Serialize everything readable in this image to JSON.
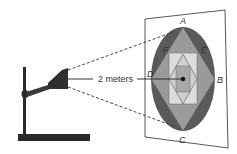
{
  "diagram": {
    "distance_label": "2 meters",
    "points": {
      "A": "A",
      "B": "B",
      "C": "C",
      "D": "D",
      "E": "E",
      "F": "F"
    },
    "colors": {
      "ellipse": "#5a5a5a",
      "outer_diamond": "#9a9a9a",
      "outer_square": "#d8d8d8",
      "inner_diamond": "#c8c8c8",
      "inner_square": "#a8a8a8",
      "stand": "#2a2a2a",
      "frame": "#444444"
    }
  }
}
